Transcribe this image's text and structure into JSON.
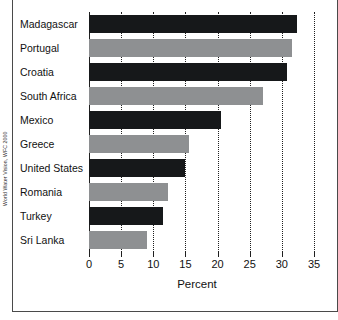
{
  "figure": {
    "source_credit": "World Water Vision, WFC 2000"
  },
  "chart_data": {
    "type": "bar",
    "orientation": "horizontal",
    "title": "",
    "subtitle": "",
    "xlabel": "Percent",
    "ylabel": "",
    "xlim": [
      0,
      35
    ],
    "xticks": [
      0,
      5,
      10,
      15,
      20,
      25,
      30,
      35
    ],
    "xtick_labels": [
      "0",
      "5",
      "10",
      "15",
      "20",
      "25",
      "30",
      "35"
    ],
    "grid": "vertical-dotted",
    "legend": "none",
    "categories": [
      "Madagascar",
      "Portugal",
      "Croatia",
      "South Africa",
      "Mexico",
      "Greece",
      "United States",
      "Romania",
      "Turkey",
      "Sri Lanka"
    ],
    "values": [
      32.3,
      31.5,
      30.8,
      27.0,
      20.5,
      15.6,
      15.0,
      12.3,
      11.5,
      9.0
    ],
    "bar_colors": [
      "#16181a",
      "#8e9092",
      "#16181a",
      "#8e9092",
      "#16181a",
      "#8e9092",
      "#16181a",
      "#8e9092",
      "#16181a",
      "#8e9092"
    ],
    "colors": {
      "dark": "#16181a",
      "light": "#8e9092",
      "axis": "#1f1f1f",
      "frame": "#4a4a4a",
      "background": "#ffffff"
    }
  }
}
